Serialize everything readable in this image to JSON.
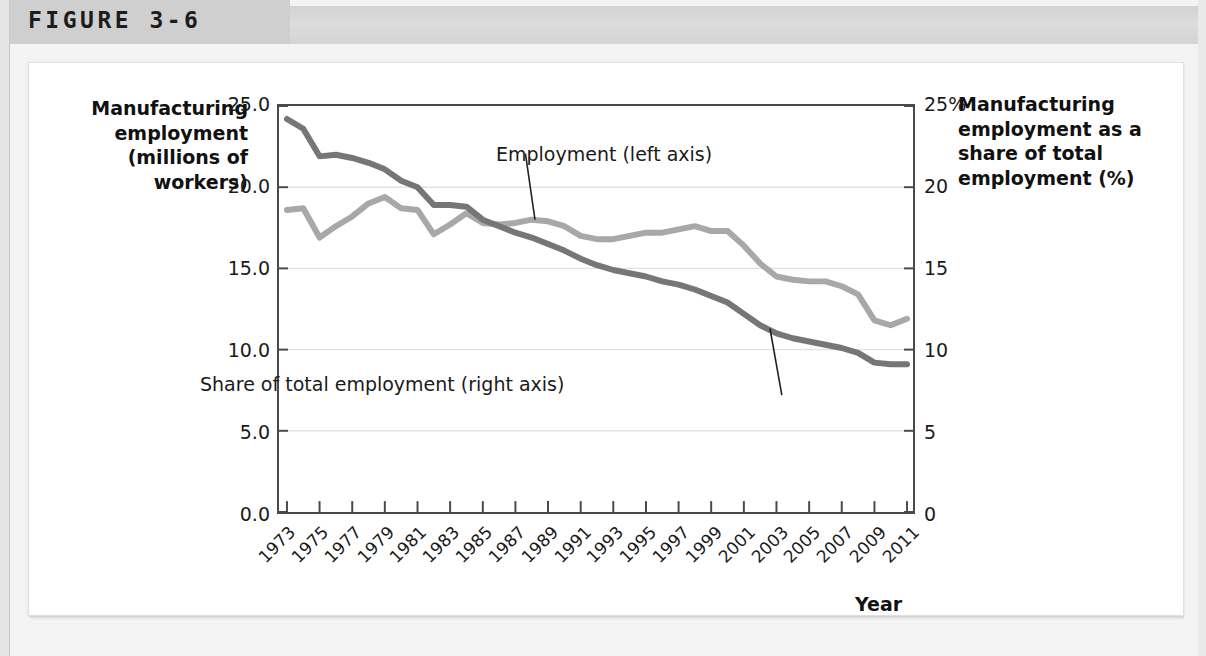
{
  "figure": {
    "label": "FIGURE 3-6"
  },
  "axis_titles": {
    "left": "Manufacturing employment (millions of workers)",
    "right": "Manufacturing employment as a share of total employment (%)",
    "x": "Year"
  },
  "annotations": {
    "employment": "Employment (left axis)",
    "share": "Share of total employment (right axis)"
  },
  "colors": {
    "employment_line": "#a8a8a8",
    "share_line": "#767676",
    "axis": "#4a4a4a",
    "gridline": "#e2e2e2",
    "header_band": "#d9d9d9",
    "header_tab": "#cfcfcf",
    "text": "#111111"
  },
  "chart_data": {
    "type": "line",
    "title": "",
    "subtitle": "",
    "xlabel": "Year",
    "grid": true,
    "legend_position": "inline-annotations",
    "x": [
      1973,
      1974,
      1975,
      1976,
      1977,
      1978,
      1979,
      1980,
      1981,
      1982,
      1983,
      1984,
      1985,
      1986,
      1987,
      1988,
      1989,
      1990,
      1991,
      1992,
      1993,
      1994,
      1995,
      1996,
      1997,
      1998,
      1999,
      2000,
      2001,
      2002,
      2003,
      2004,
      2005,
      2006,
      2007,
      2008,
      2009,
      2010,
      2011
    ],
    "xticks": [
      "1973",
      "1975",
      "1977",
      "1979",
      "1981",
      "1983",
      "1985",
      "1987",
      "1989",
      "1991",
      "1993",
      "1995",
      "1997",
      "1999",
      "2001",
      "2003",
      "2005",
      "2007",
      "2009",
      "2011"
    ],
    "axes": [
      {
        "id": "left",
        "name": "Manufacturing employment (millions of workers)",
        "ylim": [
          0.0,
          25.0
        ],
        "yticks": [
          "0.0",
          "5.0",
          "10.0",
          "15.0",
          "20.0",
          "25.0"
        ],
        "ytick_values": [
          0.0,
          5.0,
          10.0,
          15.0,
          20.0,
          25.0
        ]
      },
      {
        "id": "right",
        "name": "Manufacturing employment as a share of total employment (%)",
        "ylim": [
          0,
          25
        ],
        "yticks": [
          "0",
          "5",
          "10",
          "15",
          "20",
          "25%"
        ],
        "ytick_values": [
          0,
          5,
          10,
          15,
          20,
          25
        ]
      }
    ],
    "series": [
      {
        "name": "Employment (left axis)",
        "axis": "left",
        "color": "#a8a8a8",
        "units": "millions of workers",
        "values": [
          18.6,
          18.7,
          16.9,
          17.6,
          18.2,
          19.0,
          19.4,
          18.7,
          18.6,
          17.1,
          17.7,
          18.4,
          17.8,
          17.7,
          17.8,
          18.0,
          17.9,
          17.6,
          17.0,
          16.8,
          16.8,
          17.0,
          17.2,
          17.2,
          17.4,
          17.6,
          17.3,
          17.3,
          16.4,
          15.3,
          14.5,
          14.3,
          14.2,
          14.2,
          13.9,
          13.4,
          11.8,
          11.5,
          11.9
        ]
      },
      {
        "name": "Share of total employment (right axis)",
        "axis": "right",
        "color": "#767676",
        "units": "percent",
        "values": [
          24.2,
          23.6,
          21.9,
          22.0,
          21.8,
          21.5,
          21.1,
          20.4,
          20.0,
          18.9,
          18.9,
          18.8,
          18.0,
          17.6,
          17.2,
          16.9,
          16.5,
          16.1,
          15.6,
          15.2,
          14.9,
          14.7,
          14.5,
          14.2,
          14.0,
          13.7,
          13.3,
          12.9,
          12.2,
          11.5,
          11.0,
          10.7,
          10.5,
          10.3,
          10.1,
          9.8,
          9.2,
          9.1,
          9.1
        ]
      }
    ]
  }
}
